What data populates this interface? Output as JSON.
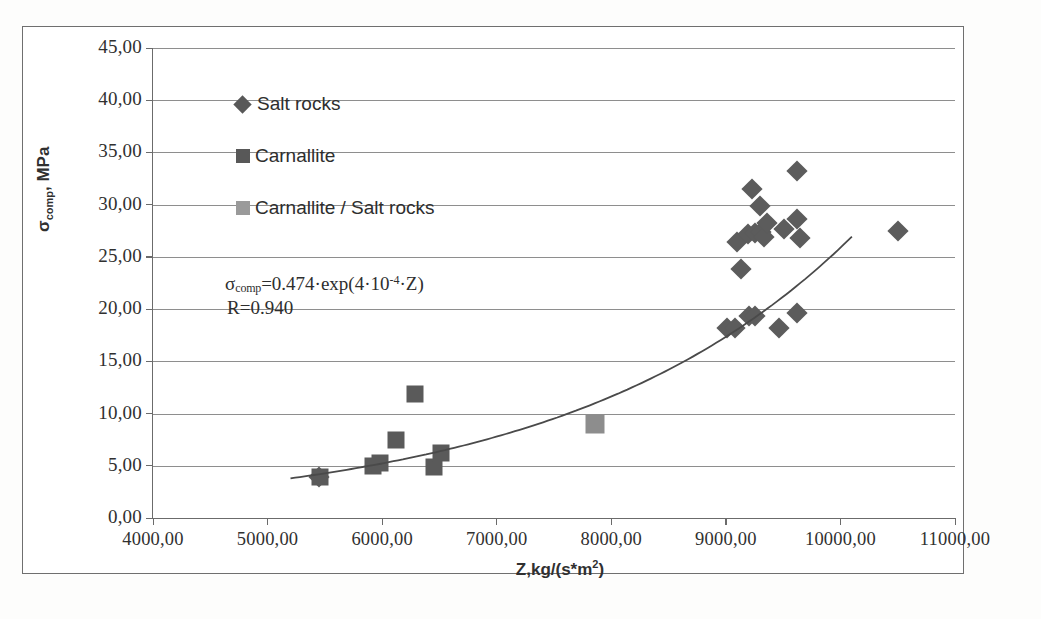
{
  "chart_data": {
    "type": "scatter",
    "title": "",
    "xlabel": "Z,kg/(s*m2)",
    "ylabel": "sigma_comp, MPa",
    "xlim": [
      4000,
      11000
    ],
    "ylim": [
      0,
      45
    ],
    "xticks": [
      "4000,00",
      "5000,00",
      "6000,00",
      "7000,00",
      "8000,00",
      "9000,00",
      "10000,00",
      "11000,00"
    ],
    "xtick_values": [
      4000,
      5000,
      6000,
      7000,
      8000,
      9000,
      10000,
      11000
    ],
    "yticks": [
      "0,00",
      "5,00",
      "10,00",
      "15,00",
      "20,00",
      "25,00",
      "30,00",
      "35,00",
      "40,00",
      "45,00"
    ],
    "ytick_values": [
      0,
      5,
      10,
      15,
      20,
      25,
      30,
      35,
      40,
      45
    ],
    "grid": "horizontal",
    "legend_position": "upper-left-inside",
    "series": [
      {
        "name": "Salt rocks",
        "marker": "diamond",
        "color": "#5c5c5c",
        "points": [
          [
            5450,
            3.9
          ],
          [
            9010,
            18.2
          ],
          [
            9080,
            18.2
          ],
          [
            9200,
            19.3
          ],
          [
            9250,
            19.3
          ],
          [
            9460,
            18.2
          ],
          [
            9620,
            19.6
          ],
          [
            9130,
            23.8
          ],
          [
            9100,
            26.4
          ],
          [
            9190,
            27.2
          ],
          [
            9250,
            27.3
          ],
          [
            9310,
            27.4
          ],
          [
            9330,
            26.9
          ],
          [
            9650,
            26.8
          ],
          [
            9360,
            28.2
          ],
          [
            9510,
            27.7
          ],
          [
            9620,
            28.6
          ],
          [
            9300,
            29.9
          ],
          [
            9230,
            31.5
          ],
          [
            9620,
            33.2
          ],
          [
            10500,
            27.5
          ]
        ]
      },
      {
        "name": "Carnallite",
        "marker": "square",
        "color": "#5a5a5a",
        "points": [
          [
            5460,
            3.9
          ],
          [
            5920,
            5.0
          ],
          [
            5980,
            5.3
          ],
          [
            6120,
            7.5
          ],
          [
            6290,
            11.9
          ],
          [
            6450,
            4.9
          ],
          [
            6510,
            6.2
          ]
        ]
      },
      {
        "name": "Carnallite / Salt rocks",
        "marker": "square-light",
        "color": "#8d8d8d",
        "points": [
          [
            7860,
            9.0
          ]
        ]
      }
    ],
    "trendline": {
      "equation_display": "0.474 · exp(4 · 10^-4 · Z)",
      "coefficient": 0.474,
      "exponent_factor": 0.0004,
      "x_start": 5200,
      "x_end": 10100,
      "color": "#4a4a4a"
    },
    "annotation": {
      "equation_prefix": "σ",
      "equation_sub": "comp",
      "equation_body": "=0.474·exp(4·10",
      "equation_sup": "-4",
      "equation_suffix": "·Z)",
      "correlation": "R=0.940"
    }
  },
  "legend": {
    "items": [
      {
        "label": "Salt rocks",
        "marker": "diamond-icon"
      },
      {
        "label": "Carnallite",
        "marker": "square-icon"
      },
      {
        "label": "Carnallite / Salt rocks",
        "marker": "square-light-icon"
      }
    ]
  },
  "axis_titles": {
    "y_main": "σ",
    "y_sub": "comp",
    "y_rest": ", MPa",
    "x_main": "Z,kg/(s*m",
    "x_sup": "2",
    "x_close": ")"
  }
}
